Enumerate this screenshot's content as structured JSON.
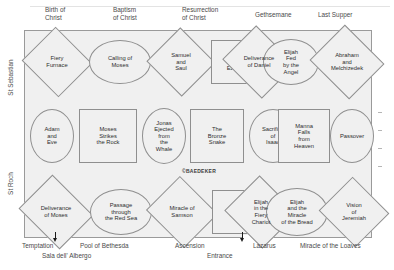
{
  "plan": {
    "title_top_labels": [
      {
        "text": "Birth of\nChrist",
        "x": 45,
        "y": 6
      },
      {
        "text": "Baptism\nof Christ",
        "x": 113,
        "y": 6
      },
      {
        "text": "Resurrection\nof Christ",
        "x": 182,
        "y": 6
      },
      {
        "text": "Gethsemane",
        "x": 255,
        "y": 11
      },
      {
        "text": "Last Supper",
        "x": 318,
        "y": 11
      }
    ],
    "bottom_labels": [
      {
        "text": "Temptation",
        "x": 22,
        "y": 242
      },
      {
        "text": "Sala dell' Albergo",
        "x": 42,
        "y": 252
      },
      {
        "text": "Pool of Bethesda",
        "x": 80,
        "y": 242
      },
      {
        "text": "Ascension",
        "x": 175,
        "y": 242
      },
      {
        "text": "Entrance",
        "x": 207,
        "y": 252
      },
      {
        "text": "Lazarus",
        "x": 253,
        "y": 242
      },
      {
        "text": "Miracle of the Loaves",
        "x": 300,
        "y": 242
      }
    ],
    "left_labels": {
      "upper": "St Sebastian",
      "lower": "St Roch"
    },
    "watermark": "©BAEDEKER",
    "rows": [
      {
        "name": "top-row",
        "y": 38,
        "h": 48,
        "cells": [
          {
            "label": "Fiery\nFurnace",
            "shape": "diamond",
            "x": 31,
            "w": 52,
            "h": 48
          },
          {
            "label": "Calling of\nMoses",
            "shape": "oval",
            "x": 89,
            "w": 62,
            "h": 44
          },
          {
            "label": "Samuel\nand\nSaul",
            "shape": "diamond",
            "x": 156,
            "w": 50,
            "h": 48
          },
          {
            "label": "Vision\nof\nEzekiel",
            "shape": "square",
            "x": 211,
            "w": 50,
            "h": 44
          },
          {
            "label": "Deliverance\nof Daniel",
            "shape": "diamond",
            "x": 231,
            "w": 56,
            "h": 48
          },
          {
            "label": "Elijah\nFed\nby the\nAngel",
            "shape": "oval",
            "x": 263,
            "w": 56,
            "h": 46
          },
          {
            "label": "Abraham\nand\nMelchizedek",
            "shape": "diamond",
            "x": 319,
            "w": 56,
            "h": 50
          }
        ]
      },
      {
        "name": "middle-row",
        "y": 108,
        "h": 56,
        "cells": [
          {
            "label": "Adam\nand\nEve",
            "shape": "oval",
            "x": 30,
            "w": 44,
            "h": 54
          },
          {
            "label": "Moses\nStrikes\nthe Rock",
            "shape": "square",
            "x": 79,
            "w": 58,
            "h": 54
          },
          {
            "label": "Jonas\nEjected\nfrom\nthe\nWhale",
            "shape": "oval",
            "x": 142,
            "w": 44,
            "h": 56
          },
          {
            "label": "The\nBronze\nSnake",
            "shape": "square",
            "x": 190,
            "w": 54,
            "h": 54
          },
          {
            "label": "Sacrifice\nof\nIsaac",
            "shape": "oval",
            "x": 249,
            "w": 48,
            "h": 54
          },
          {
            "label": "Manna\nFalls\nfrom\nHeaven",
            "shape": "square",
            "x": 278,
            "w": 52,
            "h": 54
          },
          {
            "label": "Passover",
            "shape": "oval",
            "x": 330,
            "w": 44,
            "h": 54
          }
        ]
      },
      {
        "name": "bottom-row",
        "y": 188,
        "h": 48,
        "cells": [
          {
            "label": "Deliverance\nof Moses",
            "shape": "diamond",
            "x": 27,
            "w": 58,
            "h": 48
          },
          {
            "label": "Passage\nthrough\nthe Red Sea",
            "shape": "oval",
            "x": 90,
            "w": 62,
            "h": 46
          },
          {
            "label": "Miracle of\nSamson",
            "shape": "diamond",
            "x": 155,
            "w": 54,
            "h": 48
          },
          {
            "label": "Jacob's\nLadder",
            "shape": "square",
            "x": 212,
            "w": 54,
            "h": 44
          },
          {
            "label": "Elijah\nin the\nFiery\nChariot",
            "shape": "diamond",
            "x": 234,
            "w": 54,
            "h": 50
          },
          {
            "label": "Elijah\nand the\nMiracle\nof the Bread",
            "shape": "oval",
            "x": 266,
            "w": 62,
            "h": 48
          },
          {
            "label": "Vision\nof\nJeremiah",
            "shape": "diamond",
            "x": 328,
            "w": 52,
            "h": 48
          }
        ]
      }
    ]
  }
}
